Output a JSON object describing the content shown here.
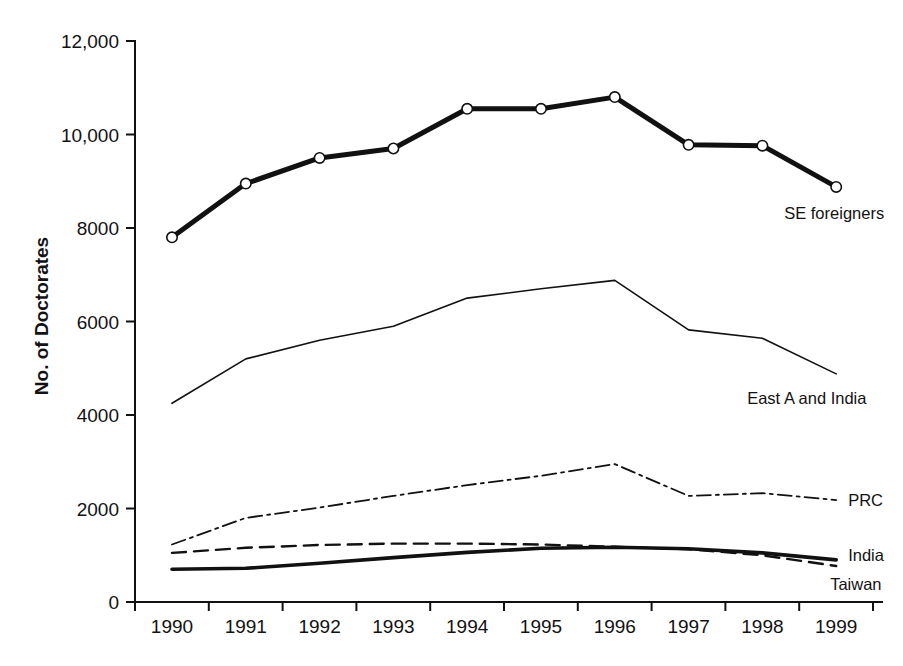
{
  "chart_data": {
    "type": "line",
    "title": "",
    "xlabel": "",
    "ylabel": "No. of Doctorates",
    "x": [
      "1990",
      "1991",
      "1992",
      "1993",
      "1994",
      "1995",
      "1996",
      "1997",
      "1998",
      "1999"
    ],
    "categories": [
      "1990",
      "1991",
      "1992",
      "1993",
      "1994",
      "1995",
      "1996",
      "1997",
      "1998",
      "1999"
    ],
    "xlim": [
      "1990",
      "1999"
    ],
    "ylim": [
      0,
      12000
    ],
    "yticks": [
      0,
      2000,
      4000,
      6000,
      8000,
      10000,
      12000
    ],
    "ytick_labels": [
      "0",
      "2000",
      "4000",
      "6000",
      "8000",
      "10,000",
      "12,000"
    ],
    "grid": false,
    "legend_position": "inline-right-of-line-end",
    "series": [
      {
        "name": "SE foreigners",
        "style": "thick-solid-with-open-circle-markers",
        "markers": true,
        "values": [
          7800,
          8950,
          9500,
          9700,
          10550,
          10550,
          10800,
          9780,
          9760,
          8880
        ]
      },
      {
        "name": "East A and India",
        "style": "thin-solid",
        "markers": false,
        "values": [
          4250,
          5200,
          5600,
          5900,
          6500,
          6700,
          6880,
          5820,
          5640,
          4880
        ]
      },
      {
        "name": "PRC",
        "style": "dash-dot",
        "markers": false,
        "values": [
          1230,
          1800,
          2020,
          2270,
          2500,
          2700,
          2950,
          2270,
          2330,
          2180
        ]
      },
      {
        "name": "India",
        "style": "medium-solid",
        "markers": false,
        "values": [
          700,
          720,
          830,
          950,
          1060,
          1150,
          1170,
          1140,
          1050,
          900
        ]
      },
      {
        "name": "Taiwan",
        "style": "dashed",
        "markers": false,
        "values": [
          1050,
          1160,
          1220,
          1250,
          1250,
          1230,
          1180,
          1130,
          1000,
          770
        ]
      }
    ],
    "annotations": [
      {
        "text": "SE foreigners",
        "anchor_series": "SE foreigners",
        "anchor_x": "1999"
      },
      {
        "text": "East A and India",
        "anchor_series": "East A and India",
        "anchor_x": "1999"
      },
      {
        "text": "PRC",
        "anchor_series": "PRC",
        "anchor_x": "1999"
      },
      {
        "text": "India",
        "anchor_series": "India",
        "anchor_x": "1999"
      },
      {
        "text": "Taiwan",
        "anchor_series": "Taiwan",
        "anchor_x": "1999"
      }
    ]
  }
}
